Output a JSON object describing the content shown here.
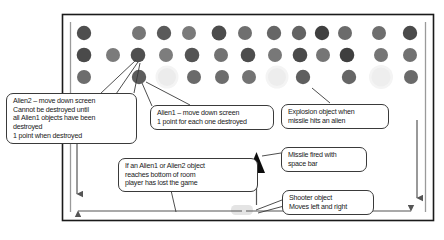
{
  "diagram": {
    "frame": {
      "name": "game-room-frame",
      "x": 62,
      "y": 14,
      "width": 372,
      "height": 207
    },
    "colors": {
      "background": "#ffffff",
      "outline": "#1a1a1a",
      "callout_border": "#3a3a3a",
      "text": "#1a1a1a",
      "alien_dark": "#4a4a4a",
      "alien_mid": "#6e6e6e",
      "alien_light": "#8a8a8a",
      "explosion": "#ececec",
      "shooter": "#e4e4e4",
      "missile": "#0d0d0d",
      "arrow": "#555555"
    },
    "aliens": {
      "row1": {
        "label": "alien-row-1",
        "y": 33,
        "dots": [
          {
            "x": 84,
            "shade": "#4f4f4f",
            "r": 7.2
          },
          {
            "x": 139,
            "shade": "#767676",
            "r": 7.0
          },
          {
            "x": 164,
            "shade": "#5a5a5a",
            "r": 7.2
          },
          {
            "x": 189,
            "shade": "#7a7a7a",
            "r": 7.0
          },
          {
            "x": 219,
            "shade": "#4c4c4c",
            "r": 7.4
          },
          {
            "x": 245,
            "shade": "#6f6f6f",
            "r": 7.0
          },
          {
            "x": 274,
            "shade": "#666666",
            "r": 7.2
          },
          {
            "x": 299,
            "shade": "#636363",
            "r": 7.2
          },
          {
            "x": 322,
            "shade": "#3f3f3f",
            "r": 7.2
          },
          {
            "x": 345,
            "shade": "#6b6b6b",
            "r": 7.0
          },
          {
            "x": 379,
            "shade": "#6e6e6e",
            "r": 7.0
          },
          {
            "x": 410,
            "shade": "#4a4a4a",
            "r": 7.2
          }
        ]
      },
      "row2": {
        "label": "alien-row-2",
        "y": 55,
        "dots": [
          {
            "x": 84,
            "shade": "#4a4a4a",
            "r": 7.3
          },
          {
            "x": 113,
            "shade": "#7b7b7b",
            "r": 7.0
          },
          {
            "x": 138,
            "shade": "#4f4f4f",
            "r": 7.3
          },
          {
            "x": 166,
            "shade": "#7d7d7d",
            "r": 7.0
          },
          {
            "x": 192,
            "shade": "#545454",
            "r": 7.3
          },
          {
            "x": 221,
            "shade": "#727272",
            "r": 7.0
          },
          {
            "x": 248,
            "shade": "#4d4d4d",
            "r": 7.3
          },
          {
            "x": 275,
            "shade": "#787878",
            "r": 7.0
          },
          {
            "x": 300,
            "shade": "#4a4a4a",
            "r": 7.3
          },
          {
            "x": 323,
            "shade": "#757575",
            "r": 7.0
          },
          {
            "x": 347,
            "shade": "#3f3f3f",
            "r": 7.3
          },
          {
            "x": 381,
            "shade": "#757575",
            "r": 7.0
          },
          {
            "x": 410,
            "shade": "#717171",
            "r": 7.0
          }
        ]
      },
      "row3": {
        "label": "alien-row-3",
        "y": 77,
        "dots": [
          {
            "x": 84,
            "shade": "#6d6d6d",
            "r": 7.0
          },
          {
            "x": 139,
            "shade": "#5d5d5d",
            "r": 7.2
          },
          {
            "x": 167,
            "shade": "#ececec",
            "r": 9.0,
            "type": "explosion"
          },
          {
            "x": 194,
            "shade": "#6a6a6a",
            "r": 7.0
          },
          {
            "x": 222,
            "shade": "#6d6d6d",
            "r": 7.0
          },
          {
            "x": 249,
            "shade": "#737373",
            "r": 7.0
          },
          {
            "x": 277,
            "shade": "#ededed",
            "r": 9.0,
            "type": "explosion"
          },
          {
            "x": 303,
            "shade": "#5f5f5f",
            "r": 7.2
          },
          {
            "x": 349,
            "shade": "#666666",
            "r": 7.2
          },
          {
            "x": 381,
            "shade": "#eeeeee",
            "r": 9.5,
            "type": "explosion"
          },
          {
            "x": 411,
            "shade": "#6a6a6a",
            "r": 7.0
          }
        ]
      }
    },
    "objects": {
      "missile": {
        "name": "missile-triangle",
        "x": 248,
        "y": 152,
        "width": 17,
        "height": 21
      },
      "shooter": {
        "name": "shooter-object",
        "x": 231,
        "y": 205,
        "width": 22,
        "height": 10
      }
    },
    "callouts": [
      {
        "name": "callout-alien2",
        "lines": [
          "Alien2 – move down screen",
          "Cannot be destroyed until",
          "all Alien1 objects have been",
          "destroyed",
          "1 point when destroyed"
        ]
      },
      {
        "name": "callout-alien1",
        "lines": [
          "Alien1 – move down screen",
          "1 point for each one destroyed"
        ]
      },
      {
        "name": "callout-explosion",
        "lines": [
          "Explosion object when",
          "missile hits an alien"
        ]
      },
      {
        "name": "callout-missile",
        "lines": [
          "Missile fired with",
          "space bar"
        ]
      },
      {
        "name": "callout-bottom-of-room",
        "lines": [
          "If an Alien1 or Alien2 object",
          "reaches bottom of room",
          "player has lost the game"
        ]
      },
      {
        "name": "callout-shooter",
        "lines": [
          "Shooter object",
          "Moves left and right"
        ]
      }
    ],
    "arrows": {
      "left_down": {
        "name": "left-down-arrow",
        "direction": "down"
      },
      "right_down": {
        "name": "right-down-arrow",
        "direction": "down"
      },
      "horizontal_left": {
        "name": "horizontal-left-arrow",
        "direction": "left"
      },
      "horizontal_right": {
        "name": "horizontal-right-arrow",
        "direction": "right"
      },
      "missile_up": {
        "name": "missile-up-arrow",
        "direction": "up"
      }
    }
  }
}
